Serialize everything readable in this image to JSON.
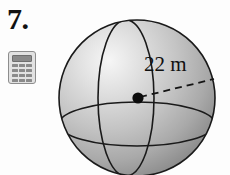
{
  "problem": {
    "number_label": "7.",
    "calculator_icon_name": "calculator-icon",
    "calculator_key_count": 12
  },
  "figure": {
    "shape_name": "sphere",
    "radius_label": "22 m",
    "radius_value": 22,
    "radius_unit": "m",
    "measurement_type": "radius",
    "center_marker": "center-dot",
    "leader_line_style": "dashed",
    "guide_circles": [
      "meridian",
      "equator"
    ],
    "colors": {
      "background": "#fdfdfd",
      "sphere_light": "#f2f2f2",
      "sphere_mid": "#bdbdbd",
      "sphere_dark": "#8e8e8e",
      "outline": "#1a1a1a",
      "text": "#101010",
      "calculator_body": "#e2e2e2",
      "calculator_keys": "#8a8a8a"
    },
    "geometry": {
      "center_x": 137,
      "center_y": 98,
      "radius_px": 78,
      "dot_x": 138,
      "dot_y": 98,
      "leader_end_x": 214,
      "leader_end_y": 79
    }
  }
}
